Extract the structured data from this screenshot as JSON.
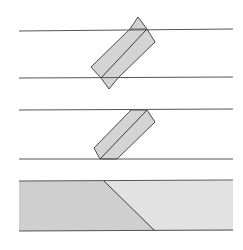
{
  "figure": {
    "colors": {
      "background": "#ffffff",
      "line": "#555555",
      "fill_strip": "#d4d4d4",
      "fill_band_left": "#cfcfcf",
      "fill_band_right": "#e2e2e2",
      "stroke": "#4a4a4a"
    },
    "panels": [
      {
        "id": "step-1",
        "guide_lines_y": [
          31,
          78
        ],
        "x_range": [
          19,
          233
        ],
        "shape": "folded strip with triangular overhangs above and below guide lines"
      },
      {
        "id": "step-2",
        "guide_lines_y": [
          110,
          159
        ],
        "x_range": [
          19,
          233
        ],
        "shape": "folded strip trimmed flush to guide lines"
      },
      {
        "id": "step-3",
        "band_y": [
          181,
          231
        ],
        "x_range": [
          19,
          233
        ],
        "shape": "flat band with diagonal seam",
        "seam": [
          [
            104,
            181
          ],
          [
            155,
            231
          ]
        ]
      }
    ]
  }
}
